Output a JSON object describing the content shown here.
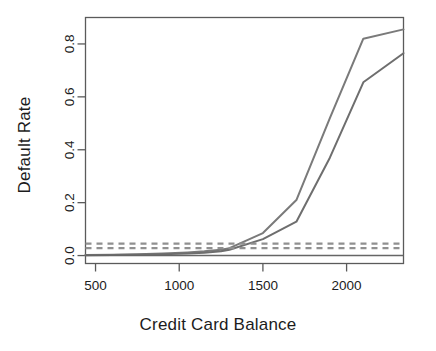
{
  "chart_data": {
    "type": "line",
    "title": "",
    "xlabel": "Credit Card Balance",
    "ylabel": "Default Rate",
    "xlim": [
      440,
      2340
    ],
    "ylim": [
      -0.03,
      0.9
    ],
    "grid": false,
    "legend": null,
    "xticks": [
      500,
      1000,
      1500,
      2000
    ],
    "xtick_labels": [
      "500",
      "1000",
      "1500",
      "2000"
    ],
    "yticks": [
      0.0,
      0.2,
      0.4,
      0.6,
      0.8
    ],
    "ytick_labels": [
      "0.0",
      "0.2",
      "0.4",
      "0.6",
      "0.8"
    ],
    "series": [
      {
        "name": "upper-curve",
        "style": "solid",
        "color": "#7a7a7a",
        "x": [
          440,
          600,
          750,
          900,
          1050,
          1150,
          1250,
          1300,
          1500,
          1700,
          1900,
          2100,
          2340
        ],
        "y": [
          0.002,
          0.003,
          0.005,
          0.008,
          0.012,
          0.016,
          0.022,
          0.028,
          0.085,
          0.21,
          0.52,
          0.82,
          0.855
        ]
      },
      {
        "name": "lower-curve",
        "style": "solid",
        "color": "#6e6e6e",
        "x": [
          440,
          600,
          750,
          900,
          1050,
          1150,
          1250,
          1300,
          1500,
          1700,
          1900,
          2100,
          2340
        ],
        "y": [
          0.001,
          0.002,
          0.003,
          0.005,
          0.008,
          0.011,
          0.016,
          0.022,
          0.062,
          0.128,
          0.37,
          0.655,
          0.765
        ]
      },
      {
        "name": "upper-dashed-threshold",
        "style": "dashed",
        "color": "#909090",
        "value": 0.045
      },
      {
        "name": "lower-dashed-threshold",
        "style": "dashed",
        "color": "#909090",
        "value": 0.028
      },
      {
        "name": "zero-baseline",
        "style": "solid",
        "color": "#666666",
        "value": 0.0
      }
    ]
  },
  "axes": {
    "x_title": "Credit Card Balance",
    "y_title": "Default Rate"
  },
  "colors": {
    "frame": "#5a5a5a",
    "text": "#1c1c1c",
    "curve_primary": "#7a7a7a",
    "curve_secondary": "#6e6e6e",
    "dashed": "#909090",
    "background": "#ffffff"
  }
}
